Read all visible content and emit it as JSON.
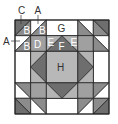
{
  "diagram": {
    "colors": {
      "white": "#ffffff",
      "medium": "#8c8c8c",
      "dark": "#6e6e6e",
      "d_square": "#a0a0a0",
      "e_light": "#b4b4b4",
      "h_center": "#b8b8b8",
      "line": "#222222",
      "label_dark": "#333333",
      "label_light": "#ffffff"
    },
    "outer_labels": {
      "top_c": "C",
      "top_a": "A",
      "left_a": "A"
    },
    "piece_labels": {
      "b1": "B",
      "b2": "B",
      "b3": "B",
      "d": "D",
      "e_left": "E",
      "f": "F",
      "e_right": "E",
      "g": "G",
      "h": "H"
    }
  }
}
